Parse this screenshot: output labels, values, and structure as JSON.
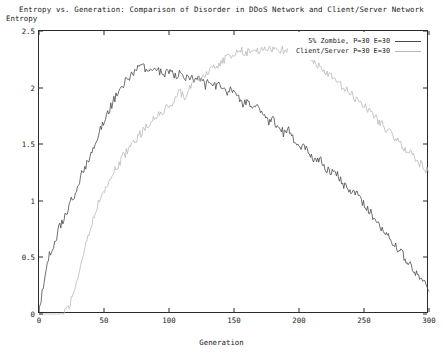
{
  "chart_data": {
    "type": "line",
    "title": "Entropy vs. Generation: Comparison of Disorder in DDoS Network and Client/Server Network",
    "xlabel": "Generation",
    "ylabel": "Entropy",
    "xlim": [
      0,
      300
    ],
    "ylim": [
      0,
      2.5
    ],
    "xticks": [
      "0",
      "50",
      "100",
      "150",
      "200",
      "250",
      "300"
    ],
    "xtick_values": [
      0,
      50,
      100,
      150,
      200,
      250,
      300
    ],
    "yticks": [
      "0",
      "0.5",
      "1",
      "1.5",
      "2",
      "2.5"
    ],
    "ytick_values": [
      0,
      0.5,
      1,
      1.5,
      2,
      2.5
    ],
    "grid": false,
    "legend_position": "top-right",
    "series": [
      {
        "name": "5% Zombie, P=30 E=30",
        "color": "#4a4a4a",
        "x": [
          0,
          4,
          8,
          12,
          16,
          20,
          24,
          28,
          32,
          36,
          40,
          44,
          48,
          52,
          56,
          60,
          64,
          68,
          72,
          76,
          80,
          84,
          88,
          92,
          96,
          100,
          104,
          108,
          112,
          116,
          120,
          124,
          128,
          132,
          136,
          140,
          144,
          148,
          152,
          156,
          160,
          164,
          168,
          172,
          176,
          180,
          184,
          188,
          192,
          196,
          200,
          204,
          208,
          212,
          216,
          220,
          224,
          228,
          232,
          236,
          240,
          244,
          248,
          252,
          256,
          260,
          264,
          268,
          272,
          276,
          280,
          284,
          288,
          292,
          296,
          300
        ],
        "values": [
          0.02,
          0.3,
          0.52,
          0.62,
          0.78,
          0.86,
          1.0,
          1.06,
          1.22,
          1.3,
          1.42,
          1.54,
          1.66,
          1.75,
          1.85,
          1.95,
          2.02,
          2.08,
          2.12,
          2.16,
          2.18,
          2.14,
          2.17,
          2.15,
          2.12,
          2.14,
          2.1,
          2.12,
          2.08,
          2.1,
          2.05,
          2.08,
          2.02,
          2.06,
          2.0,
          2.02,
          1.96,
          1.98,
          1.92,
          1.86,
          1.88,
          1.8,
          1.84,
          1.76,
          1.7,
          1.72,
          1.66,
          1.6,
          1.62,
          1.54,
          1.48,
          1.5,
          1.42,
          1.36,
          1.38,
          1.3,
          1.24,
          1.26,
          1.18,
          1.12,
          1.06,
          1.08,
          1.0,
          0.94,
          0.88,
          0.82,
          0.76,
          0.7,
          0.64,
          0.58,
          0.52,
          0.46,
          0.4,
          0.34,
          0.28,
          0.2
        ]
      },
      {
        "name": "Client/Server P=30 E=30",
        "color": "#b9b9b9",
        "x": [
          0,
          4,
          8,
          12,
          16,
          20,
          24,
          28,
          32,
          36,
          40,
          44,
          48,
          52,
          56,
          60,
          64,
          68,
          72,
          76,
          80,
          84,
          88,
          92,
          96,
          100,
          104,
          108,
          112,
          116,
          120,
          124,
          128,
          132,
          136,
          140,
          144,
          148,
          152,
          156,
          160,
          164,
          168,
          172,
          176,
          180,
          184,
          188,
          192,
          196,
          200,
          204,
          208,
          212,
          216,
          220,
          224,
          228,
          232,
          236,
          240,
          244,
          248,
          252,
          256,
          260,
          264,
          268,
          272,
          276,
          280,
          284,
          288,
          292,
          296,
          300
        ],
        "values": [
          0.0,
          0.0,
          0.0,
          0.0,
          0.0,
          0.02,
          0.1,
          0.26,
          0.44,
          0.62,
          0.78,
          0.92,
          1.04,
          1.14,
          1.22,
          1.3,
          1.38,
          1.44,
          1.5,
          1.56,
          1.62,
          1.66,
          1.72,
          1.76,
          1.8,
          1.84,
          1.88,
          1.96,
          1.92,
          2.0,
          2.04,
          2.08,
          2.12,
          2.16,
          2.18,
          2.22,
          2.26,
          2.28,
          2.3,
          2.32,
          2.31,
          2.33,
          2.32,
          2.34,
          2.33,
          2.35,
          2.34,
          2.33,
          2.34,
          2.32,
          2.3,
          2.28,
          2.26,
          2.22,
          2.18,
          2.14,
          2.1,
          2.06,
          2.02,
          1.98,
          1.94,
          1.9,
          1.86,
          1.82,
          1.78,
          1.72,
          1.68,
          1.62,
          1.58,
          1.52,
          1.48,
          1.44,
          1.4,
          1.34,
          1.3,
          1.25
        ]
      }
    ]
  }
}
